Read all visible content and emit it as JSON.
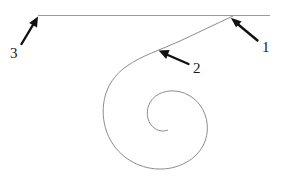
{
  "figure": {
    "background_color": "#ffffff",
    "width": 287,
    "height": 181,
    "curve_color": "#8c8c8c",
    "line_color": "#9a9a9a",
    "arrow_color": "#111111",
    "label_color": "#1a1a1a"
  },
  "baseline": {
    "name": "horizontal-line",
    "x1": 38,
    "y1": 15.5,
    "x2": 270,
    "y2": 15.5,
    "stroke_width": 1
  },
  "spiral": {
    "name": "spiral-curve",
    "type": "logarithmic",
    "center_x": 163,
    "center_y": 111,
    "inner_radius": 12,
    "outer_radius": 58,
    "turns": 1.95,
    "tail_end_x": 233,
    "tail_end_y": 16,
    "stroke_width": 1
  },
  "callouts": [
    {
      "id": "1",
      "label": "1",
      "name": "callout-arrow-1",
      "points_to": "junction of spiral tail and horizontal line",
      "tip_x": 231,
      "tip_y": 18,
      "tail_x": 258,
      "tail_y": 40,
      "label_x": 262,
      "label_y": 40,
      "direction": "up-left"
    },
    {
      "id": "2",
      "label": "2",
      "name": "callout-arrow-2",
      "points_to": "spiral outer arc",
      "tip_x": 159,
      "tip_y": 50,
      "tail_x": 189,
      "tail_y": 64,
      "label_x": 193,
      "label_y": 61,
      "direction": "up-left"
    },
    {
      "id": "3",
      "label": "3",
      "name": "callout-arrow-3",
      "points_to": "left end of horizontal line",
      "tip_x": 38,
      "tip_y": 17,
      "tail_x": 21,
      "tail_y": 44,
      "label_x": 10,
      "label_y": 46,
      "direction": "up-right"
    }
  ]
}
